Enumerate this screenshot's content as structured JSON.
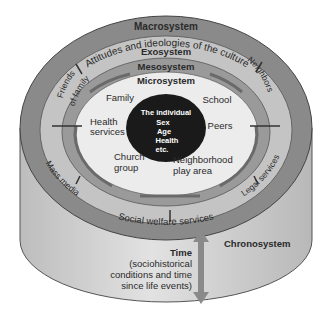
{
  "diagram": {
    "type": "bioecological-model",
    "layers": {
      "macrosystem": {
        "title": "Macrosystem",
        "subtitle": "Attitudes and ideologies of the culture"
      },
      "exosystem": {
        "title": "Exosystem",
        "items": [
          "Friends of family",
          "Neighbors",
          "Mass media",
          "Legal services",
          "Social welfare services"
        ]
      },
      "mesosystem": {
        "title": "Mesosystem"
      },
      "microsystem": {
        "title": "Microsystem",
        "items": [
          "Family",
          "School",
          "Health services",
          "Peers",
          "Church group",
          "Neighborhood play area"
        ]
      },
      "individual": {
        "title": "The individual",
        "traits": [
          "Sex",
          "Age",
          "Health",
          "etc."
        ]
      },
      "chronosystem": {
        "title": "Chronosystem",
        "time_title": "Time",
        "time_desc": [
          "(sociohistorical",
          "conditions and time",
          "since life events)"
        ]
      }
    },
    "colors": {
      "macro": "#8a8a8a",
      "exo": "#c4c4c4",
      "meso": "#9a9a9a",
      "micro": "#ececec",
      "individual": "#1a1a1a",
      "cylinder": "#cfcfcf",
      "arrow": "#7a7a7a"
    }
  }
}
